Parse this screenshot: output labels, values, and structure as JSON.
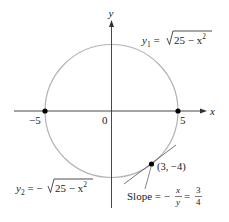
{
  "figure": {
    "circle": {
      "equation_upper": {
        "lhs": "y",
        "sub": "1",
        "eq": " = ",
        "radicand": "25 − x",
        "exp": "2"
      },
      "equation_lower": {
        "lhs": "y",
        "sub": "2",
        "eq": " = −",
        "radicand": "25 − x",
        "exp": "2"
      },
      "color": "#b3b3b3",
      "radius_units": 5
    },
    "axes": {
      "x_label": "x",
      "y_label": "y",
      "origin_label": "0",
      "tick_neg": "−5",
      "tick_pos": "5",
      "color": "#333333"
    },
    "points": [
      {
        "x": -5,
        "y": 0
      },
      {
        "x": 5,
        "y": 0
      },
      {
        "x": 3,
        "y": -4,
        "label": "(3, −4)"
      }
    ],
    "tangent": {
      "slope_label": "Slope = −",
      "frac1_num": "x",
      "frac1_den": "y",
      "eq": " = ",
      "frac2_num": "3",
      "frac2_den": "4"
    }
  }
}
